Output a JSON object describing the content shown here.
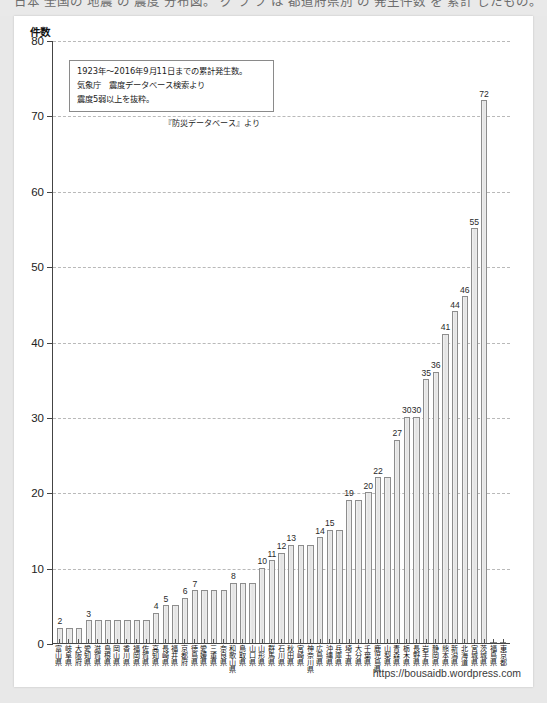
{
  "top_strip": {
    "cropped_text": "日本 全国の 地震 の 震度 分布図。 グ ラ フ は 都道府県別 の 発生件数 を 累計 したもの。"
  },
  "annotation": {
    "lines": [
      "1923年～2016年9月11日までの累計発生数。",
      "気象庁　震度データベース検索より",
      "震度5弱以上を抜粋。"
    ],
    "source_note": "『防災データベース』より"
  },
  "footer": {
    "url": "https://bousaidb.wordpress.com"
  },
  "chart_data": {
    "type": "bar",
    "title": "",
    "xlabel": "",
    "ylabel": "件数",
    "ylim": [
      0,
      80
    ],
    "yticks": [
      0,
      10,
      20,
      30,
      40,
      50,
      60,
      70,
      80
    ],
    "grid": true,
    "legend": "none",
    "categories": [
      "富山県",
      "岐阜県",
      "大阪府",
      "愛知県",
      "滋賀県",
      "島根県",
      "岡山県",
      "香川県",
      "福岡県",
      "佐賀県",
      "高知県",
      "長崎県",
      "福井県",
      "京都府",
      "徳島県",
      "愛媛県",
      "三重県",
      "奈良県",
      "和歌山県",
      "鳥取県",
      "山口県",
      "山形県",
      "群馬県",
      "石川県",
      "秋田県",
      "宮崎県",
      "神奈川県",
      "広島県",
      "沖縄県",
      "兵庫県",
      "埼玉県",
      "大分県",
      "千葉県",
      "鹿児島県",
      "山梨県",
      "青森県",
      "栃木県",
      "長野県",
      "岩手県",
      "静岡県",
      "熊本県",
      "新潟県",
      "北海道",
      "宮城県",
      "茨城県",
      "福島県",
      "東京都"
    ],
    "values": [
      2,
      2,
      2,
      3,
      3,
      3,
      3,
      3,
      3,
      3,
      4,
      5,
      5,
      6,
      7,
      7,
      7,
      7,
      8,
      8,
      8,
      10,
      11,
      12,
      13,
      13,
      13,
      14,
      15,
      15,
      19,
      19,
      20,
      22,
      22,
      27,
      30,
      30,
      35,
      36,
      41,
      44,
      46,
      55,
      72,
      0,
      0
    ],
    "labeled_values": [
      {
        "index": 0,
        "value": 2,
        "label": "2"
      },
      {
        "index": 3,
        "value": 3,
        "label": "3"
      },
      {
        "index": 10,
        "value": 4,
        "label": "4"
      },
      {
        "index": 11,
        "value": 5,
        "label": "5"
      },
      {
        "index": 13,
        "value": 6,
        "label": "6"
      },
      {
        "index": 14,
        "value": 7,
        "label": "7"
      },
      {
        "index": 18,
        "value": 8,
        "label": "8"
      },
      {
        "index": 21,
        "value": 10,
        "label": "10"
      },
      {
        "index": 22,
        "value": 11,
        "label": "11"
      },
      {
        "index": 23,
        "value": 12,
        "label": "12"
      },
      {
        "index": 24,
        "value": 13,
        "label": "13"
      },
      {
        "index": 27,
        "value": 14,
        "label": "14"
      },
      {
        "index": 28,
        "value": 15,
        "label": "15"
      },
      {
        "index": 30,
        "value": 19,
        "label": "19"
      },
      {
        "index": 32,
        "value": 20,
        "label": "20"
      },
      {
        "index": 33,
        "value": 22,
        "label": "22"
      },
      {
        "index": 35,
        "value": 27,
        "label": "27"
      },
      {
        "index": 36,
        "value": 30,
        "label": "30"
      },
      {
        "index": 37,
        "value": 30,
        "label": "30"
      },
      {
        "index": 38,
        "value": 35,
        "label": "35"
      },
      {
        "index": 39,
        "value": 36,
        "label": "36"
      },
      {
        "index": 40,
        "value": 41,
        "label": "41"
      },
      {
        "index": 41,
        "value": 44,
        "label": "44"
      },
      {
        "index": 42,
        "value": 46,
        "label": "46"
      },
      {
        "index": 43,
        "value": 55,
        "label": "55"
      },
      {
        "index": 44,
        "value": 72,
        "label": "72"
      }
    ],
    "colors": {
      "bar_fill": "#e9e9e9",
      "bar_stroke": "#8d8d8d",
      "axis": "#444444",
      "grid": "#b9b9b9",
      "page_bg": "#ffffff",
      "canvas_bg": "#e8e8e8"
    }
  }
}
